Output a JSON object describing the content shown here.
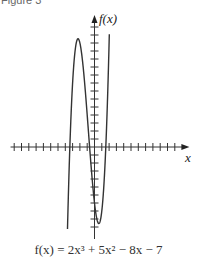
{
  "figure": {
    "label": "Figure 3",
    "caption": "f(x) = 2x³ + 5x² − 8x − 7"
  },
  "chart_data": {
    "type": "line",
    "title": "",
    "function": "f(x) = 2x^3 + 5x^2 - 8x - 7",
    "coefficients": [
      2,
      5,
      -8,
      -7
    ],
    "xlabel": "x",
    "ylabel": "f(x)",
    "xlim": [
      -3.7,
      2.03
    ],
    "axis_xrange": [
      -11.5,
      13
    ],
    "axis_yrange": [
      -11.5,
      16.5
    ],
    "x_tick_step": 1,
    "y_tick_step": 1,
    "grid": false,
    "legend": null,
    "key_points": [
      {
        "name": "local maximum",
        "x": -2.26,
        "y": 13.5
      },
      {
        "name": "local minimum",
        "x": 0.59,
        "y": -9.57
      },
      {
        "name": "y-intercept",
        "x": 0,
        "y": -7
      }
    ],
    "series": [
      {
        "name": "f(x)",
        "color": "#333333"
      }
    ]
  },
  "layout": {
    "origin_px": [
      94.5,
      147
    ],
    "px_per_unit_x": 7.3,
    "px_per_unit_y": 8
  }
}
